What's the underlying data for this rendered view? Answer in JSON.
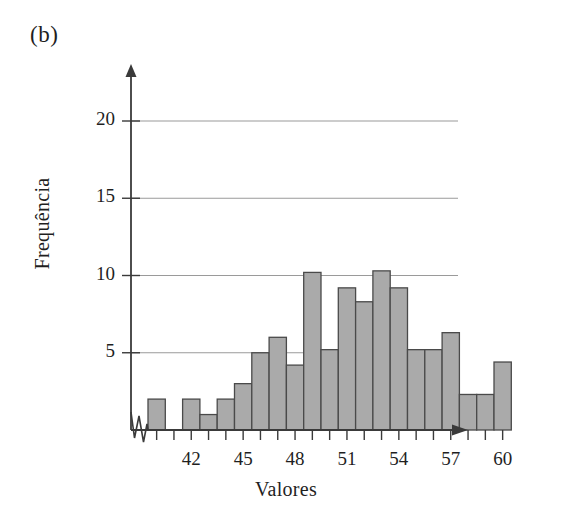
{
  "panel": {
    "label": "(b)"
  },
  "colors": {
    "bar_fill": "#aaaaaa",
    "bar_stroke": "#4a4a4a",
    "axis": "#3a3a3a",
    "grid": "#9a9a9a",
    "background": "#ffffff",
    "text": "#1f1f1f"
  },
  "chart_data": {
    "type": "bar",
    "title": "",
    "subtitle": "",
    "xlabel": "Valores",
    "ylabel": "Frequência",
    "grid": true,
    "legend": "none",
    "axis_break_x": true,
    "xlim": [
      39,
      61
    ],
    "ylim": [
      0,
      21.5
    ],
    "ytick_values": [
      5,
      10,
      15,
      20
    ],
    "ytick_labels": [
      "5",
      "10",
      "15",
      "20"
    ],
    "xtick_values": [
      40,
      41,
      42,
      43,
      44,
      45,
      46,
      47,
      48,
      49,
      50,
      51,
      52,
      53,
      54,
      55,
      56,
      57,
      58,
      59,
      60
    ],
    "xtick_labeled": [
      42,
      45,
      48,
      51,
      54,
      57,
      60
    ],
    "xtick_labels": [
      "42",
      "45",
      "48",
      "51",
      "54",
      "57",
      "60"
    ],
    "bin_width": 1,
    "categories": [
      40,
      41,
      42,
      43,
      44,
      45,
      46,
      47,
      48,
      49,
      50,
      51,
      52,
      53,
      54,
      55,
      56,
      57,
      58,
      59,
      60
    ],
    "values": [
      2,
      0,
      2,
      1,
      2,
      3,
      5,
      6,
      4.2,
      10.2,
      5.2,
      9.2,
      8.3,
      10.3,
      9.2,
      5.2,
      5.2,
      6.3,
      2.3,
      2.3,
      4.4
    ],
    "bars": [
      {
        "bin_start": 40,
        "bin_end": 41,
        "frequency": 2
      },
      {
        "bin_start": 41,
        "bin_end": 42,
        "frequency": 0
      },
      {
        "bin_start": 42,
        "bin_end": 43,
        "frequency": 2
      },
      {
        "bin_start": 43,
        "bin_end": 44,
        "frequency": 1
      },
      {
        "bin_start": 44,
        "bin_end": 45,
        "frequency": 2
      },
      {
        "bin_start": 45,
        "bin_end": 46,
        "frequency": 3
      },
      {
        "bin_start": 46,
        "bin_end": 47,
        "frequency": 5
      },
      {
        "bin_start": 47,
        "bin_end": 48,
        "frequency": 6
      },
      {
        "bin_start": 48,
        "bin_end": 49,
        "frequency": 4.2
      },
      {
        "bin_start": 49,
        "bin_end": 50,
        "frequency": 10.2
      },
      {
        "bin_start": 50,
        "bin_end": 51,
        "frequency": 5.2
      },
      {
        "bin_start": 51,
        "bin_end": 52,
        "frequency": 9.2
      },
      {
        "bin_start": 52,
        "bin_end": 53,
        "frequency": 8.3
      },
      {
        "bin_start": 53,
        "bin_end": 54,
        "frequency": 10.3
      },
      {
        "bin_start": 54,
        "bin_end": 55,
        "frequency": 9.2
      },
      {
        "bin_start": 55,
        "bin_end": 56,
        "frequency": 5.2
      },
      {
        "bin_start": 56,
        "bin_end": 57,
        "frequency": 5.2
      },
      {
        "bin_start": 57,
        "bin_end": 58,
        "frequency": 6.3
      },
      {
        "bin_start": 58,
        "bin_end": 59,
        "frequency": 2.3
      },
      {
        "bin_start": 59,
        "bin_end": 60,
        "frequency": 2.3
      },
      {
        "bin_start": 60,
        "bin_end": 61,
        "frequency": 4.4
      }
    ]
  }
}
